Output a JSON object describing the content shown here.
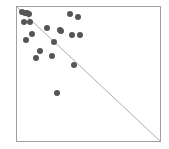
{
  "chart_data": {
    "type": "scatter",
    "title": "",
    "xlabel": "",
    "ylabel": "",
    "grid": false,
    "legend": null,
    "frame": {
      "x0": 16,
      "y0": 6,
      "x1": 160,
      "y1": 141
    },
    "reference_line": {
      "type": "diagonal",
      "from": [
        16,
        6
      ],
      "to": [
        160,
        141
      ],
      "color": "#9a9a9a"
    },
    "point_color": "#555555",
    "point_radius": 3,
    "points_px": [
      [
        22,
        12
      ],
      [
        25,
        13
      ],
      [
        27,
        13
      ],
      [
        29,
        14
      ],
      [
        24,
        22
      ],
      [
        30,
        22
      ],
      [
        32,
        34
      ],
      [
        26,
        40
      ],
      [
        47,
        28
      ],
      [
        60,
        30
      ],
      [
        61,
        31
      ],
      [
        70,
        14
      ],
      [
        78,
        17
      ],
      [
        72,
        35
      ],
      [
        80,
        35
      ],
      [
        54,
        42
      ],
      [
        40,
        51
      ],
      [
        36,
        58
      ],
      [
        52,
        56
      ],
      [
        74,
        65
      ],
      [
        57,
        93
      ]
    ]
  },
  "colors": {
    "frame": "#a0a0a0",
    "background": "#ffffff"
  }
}
